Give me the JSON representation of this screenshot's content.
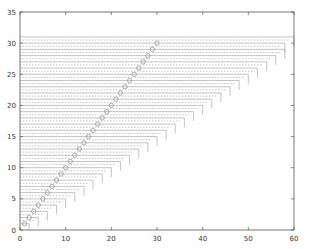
{
  "chart_data": {
    "type": "line",
    "title": "",
    "xlabel": "",
    "ylabel": "",
    "xlim": [
      0,
      60
    ],
    "ylim": [
      0,
      35
    ],
    "grid": false,
    "legend": null,
    "x_ticks": [
      "0",
      "10",
      "20",
      "30",
      "40",
      "50",
      "60"
    ],
    "y_ticks": [
      "0",
      "5",
      "10",
      "15",
      "20",
      "25",
      "30",
      "35"
    ],
    "series": [
      {
        "name": "circles",
        "style": "scatter-circle",
        "x": [
          1,
          2,
          3,
          4,
          5,
          6,
          7,
          8,
          9,
          10,
          11,
          12,
          13,
          14,
          15,
          16,
          17,
          18,
          19,
          20,
          21,
          22,
          23,
          24,
          25,
          26,
          27,
          28,
          29,
          30
        ],
        "y": [
          1,
          2,
          3,
          4,
          5,
          6,
          7,
          8,
          9,
          10,
          11,
          12,
          13,
          14,
          15,
          16,
          17,
          18,
          19,
          20,
          21,
          22,
          23,
          24,
          25,
          26,
          27,
          28,
          29,
          30
        ]
      },
      {
        "name": "staircase-levels",
        "style": "horizontal segments from x=0 to x=2y with vertical drop (dotted pairs)",
        "levels_y": [
          1,
          2,
          3,
          4,
          5,
          6,
          7,
          8,
          9,
          10,
          11,
          12,
          13,
          14,
          15,
          16,
          17,
          18,
          19,
          20,
          21,
          22,
          23,
          24,
          25,
          26,
          27,
          28,
          29,
          30,
          31
        ],
        "end_x": [
          2,
          4,
          6,
          8,
          10,
          12,
          14,
          16,
          18,
          20,
          22,
          24,
          26,
          28,
          30,
          32,
          34,
          36,
          38,
          40,
          42,
          44,
          46,
          48,
          50,
          52,
          54,
          56,
          58,
          58,
          60
        ]
      }
    ],
    "colors": {
      "axis": "#555555",
      "line": "#9a9a9a",
      "marker": "#8a8a8a"
    }
  }
}
